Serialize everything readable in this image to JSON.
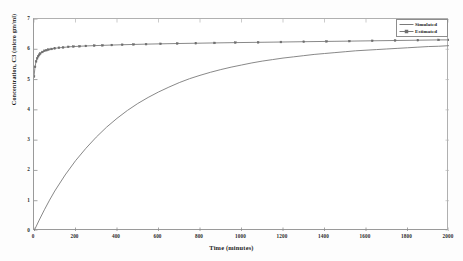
{
  "chart_data": {
    "type": "line",
    "title": "",
    "xlabel": "Time (minutes)",
    "ylabel": "Concentration, C3 (micro gm/ml)",
    "xlim": [
      0,
      2000
    ],
    "ylim": [
      0,
      7
    ],
    "xticks": [
      "0",
      "200",
      "400",
      "600",
      "800",
      "1000",
      "1200",
      "1400",
      "1600",
      "1800",
      "2000"
    ],
    "yticks": [
      "0",
      "1",
      "2",
      "3",
      "4",
      "5",
      "6",
      "7"
    ],
    "grid": false,
    "legend_position": "top-right",
    "series": [
      {
        "name": "Simulated",
        "marker": "none",
        "color": "#7a7a7a",
        "x": [
          0,
          25,
          50,
          75,
          100,
          150,
          200,
          250,
          300,
          350,
          400,
          450,
          500,
          550,
          600,
          650,
          700,
          750,
          800,
          850,
          900,
          950,
          1000,
          1050,
          1100,
          1150,
          1200,
          1250,
          1300,
          1350,
          1400,
          1450,
          1500,
          1550,
          1600,
          1650,
          1700,
          1750,
          1800,
          1850,
          1900,
          1950,
          2000
        ],
        "y": [
          0.0,
          0.36,
          0.7,
          1.02,
          1.32,
          1.85,
          2.32,
          2.73,
          3.1,
          3.43,
          3.72,
          3.98,
          4.21,
          4.41,
          4.59,
          4.75,
          4.9,
          5.03,
          5.14,
          5.24,
          5.33,
          5.41,
          5.48,
          5.55,
          5.61,
          5.66,
          5.71,
          5.75,
          5.79,
          5.83,
          5.86,
          5.89,
          5.92,
          5.95,
          5.97,
          5.99,
          6.01,
          6.03,
          6.05,
          6.07,
          6.09,
          6.1,
          6.12
        ]
      },
      {
        "name": "Estimated",
        "marker": "square",
        "color": "#7a7a7a",
        "x": [
          0,
          5,
          10,
          15,
          20,
          25,
          30,
          40,
          50,
          60,
          70,
          85,
          100,
          120,
          140,
          165,
          190,
          220,
          250,
          290,
          330,
          375,
          425,
          480,
          540,
          610,
          690,
          780,
          870,
          970,
          1080,
          1190,
          1300,
          1410,
          1520,
          1630,
          1740,
          1850,
          1950,
          2000
        ],
        "y": [
          5.1,
          5.42,
          5.6,
          5.7,
          5.77,
          5.82,
          5.86,
          5.91,
          5.95,
          5.97,
          5.99,
          6.01,
          6.03,
          6.05,
          6.06,
          6.08,
          6.09,
          6.1,
          6.11,
          6.12,
          6.13,
          6.14,
          6.15,
          6.16,
          6.17,
          6.18,
          6.19,
          6.2,
          6.21,
          6.22,
          6.23,
          6.24,
          6.25,
          6.26,
          6.27,
          6.28,
          6.29,
          6.3,
          6.31,
          6.31
        ]
      }
    ]
  },
  "legend": {
    "items": [
      {
        "label": "Simulated"
      },
      {
        "label": "Estimated"
      }
    ]
  },
  "axes": {
    "x_title": "Time (minutes)",
    "y_title": "Concentration, C3 (micro gm/ml)"
  }
}
